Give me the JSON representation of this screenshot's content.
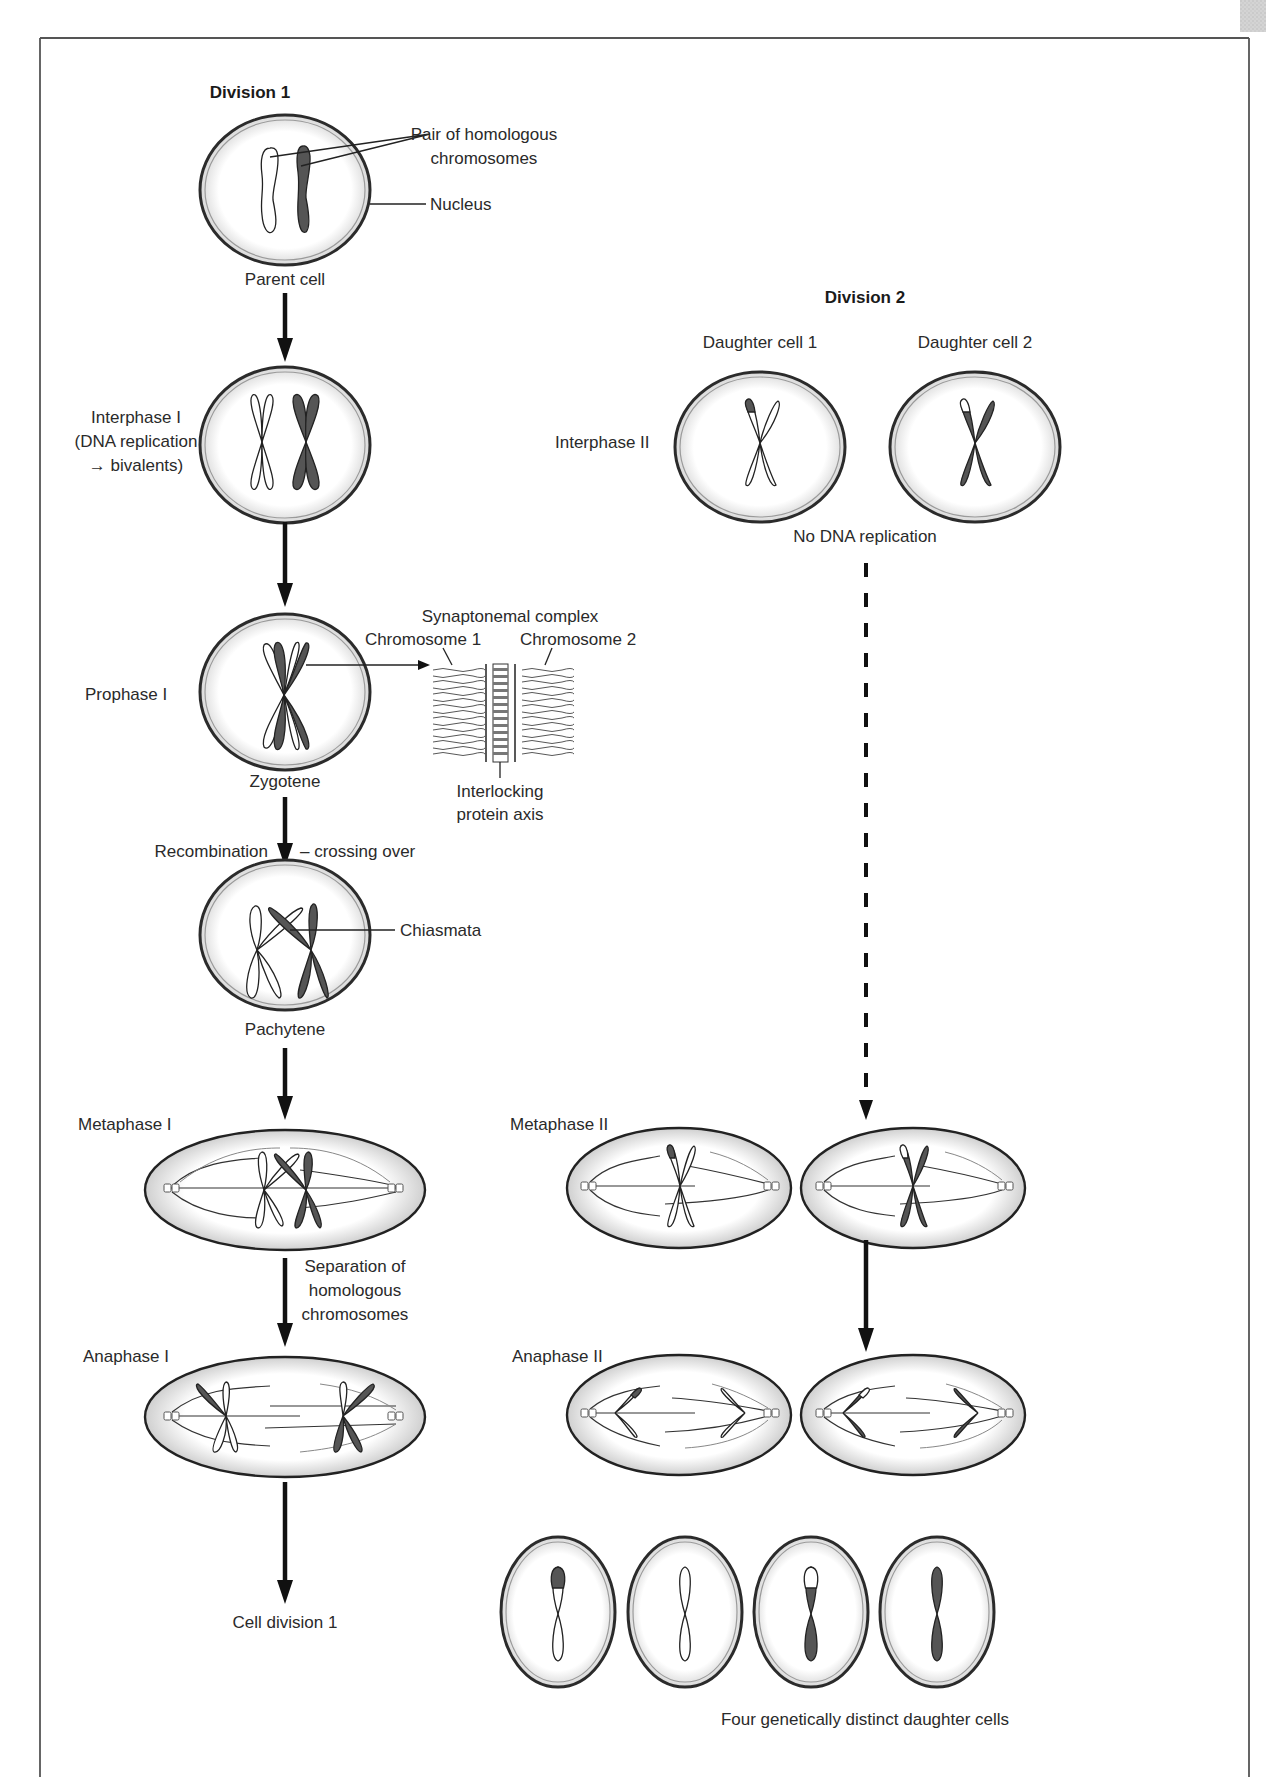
{
  "division1": {
    "title": "Division 1",
    "parent_cell": {
      "label": "Parent cell",
      "annotations": {
        "homologous_line1": "Pair of homologous",
        "homologous_line2": "chromosomes",
        "nucleus": "Nucleus"
      }
    },
    "interphase1": {
      "label_line1": "Interphase I",
      "label_line2": "(DNA replication",
      "label_line3": "→ bivalents)"
    },
    "prophase1": {
      "label": "Prophase I",
      "sublabel": "Zygotene",
      "synaptonemal": {
        "title": "Synaptonemal complex",
        "chromosome1": "Chromosome 1",
        "chromosome2": "Chromosome 2",
        "axis_line1": "Interlocking",
        "axis_line2": "protein axis"
      }
    },
    "recombination": {
      "left": "Recombination",
      "right": "– crossing over"
    },
    "pachytene": {
      "label": "Pachytene",
      "annotation": "Chiasmata"
    },
    "metaphase1": {
      "label": "Metaphase I"
    },
    "separation": {
      "line1": "Separation of",
      "line2": "homologous",
      "line3": "chromosomes"
    },
    "anaphase1": {
      "label": "Anaphase I"
    },
    "end_label": "Cell division 1"
  },
  "division2": {
    "title": "Division 2",
    "daughter1": "Daughter cell 1",
    "daughter2": "Daughter cell 2",
    "interphase2": {
      "label": "Interphase II"
    },
    "no_replication": "No DNA replication",
    "metaphase2": {
      "label": "Metaphase II"
    },
    "anaphase2": {
      "label": "Anaphase II"
    },
    "final_caption": "Four genetically distinct daughter cells",
    "final_cells": [
      {
        "top": "dark",
        "bottom": "light"
      },
      {
        "top": "light",
        "bottom": "light"
      },
      {
        "top": "light-over-dark",
        "bottom": "dark"
      },
      {
        "top": "dark",
        "bottom": "dark"
      }
    ]
  },
  "colors": {
    "ink": "#222222",
    "chromosome_dark": "#555555",
    "chromosome_light": "#ffffff",
    "frame": "#555555"
  }
}
